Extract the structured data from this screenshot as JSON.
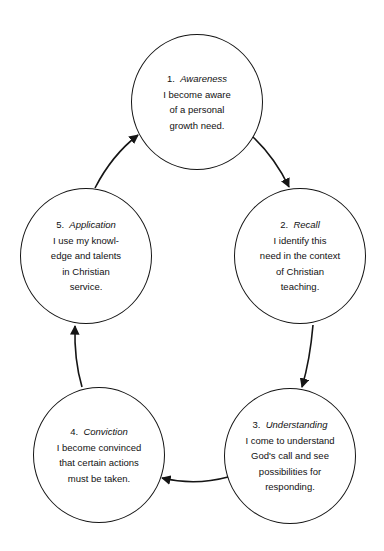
{
  "diagram": {
    "type": "cycle",
    "stages": [
      {
        "number": "1.",
        "name": "Awareness",
        "lines": [
          "I become aware",
          "of a personal",
          "growth need."
        ]
      },
      {
        "number": "2.",
        "name": "Recall",
        "lines": [
          "I identify this",
          "need in the context",
          "of Christian",
          "teaching."
        ]
      },
      {
        "number": "3.",
        "name": "Understanding",
        "lines": [
          "I come to understand",
          "God's call and see",
          "possibilities for",
          "responding."
        ]
      },
      {
        "number": "4.",
        "name": "Conviction",
        "lines": [
          "I become convinced",
          "that certain actions",
          "must be taken."
        ]
      },
      {
        "number": "5.",
        "name": "Application",
        "lines": [
          "I use my knowl-",
          "edge and talents",
          "in Christian",
          "service."
        ]
      }
    ],
    "flow": [
      "1→2",
      "2→3",
      "3→4",
      "4→5",
      "5→1"
    ],
    "colors": {
      "stroke": "#151515",
      "background": "#ffffff"
    }
  }
}
